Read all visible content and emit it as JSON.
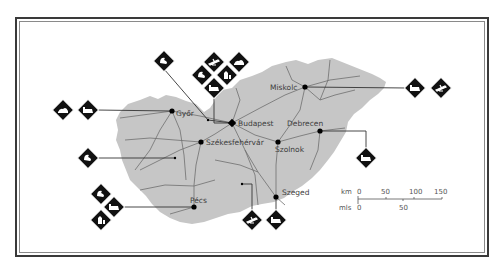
{
  "map": {
    "land_color": "#c8c8c8",
    "road_color": "#6e6e6e",
    "frame_color": "#3a3a3a",
    "icon_color": "#111111",
    "cities": [
      {
        "name": "Győr",
        "x": 172,
        "y": 111
      },
      {
        "name": "Budapest",
        "x": 232,
        "y": 123
      },
      {
        "name": "Miskolc",
        "x": 305,
        "y": 87
      },
      {
        "name": "Debrecen",
        "x": 320,
        "y": 131
      },
      {
        "name": "Székesfehérvár",
        "x": 201,
        "y": 142
      },
      {
        "name": "Szolnok",
        "x": 278,
        "y": 142
      },
      {
        "name": "Pécs",
        "x": 194,
        "y": 207
      },
      {
        "name": "Szeged",
        "x": 276,
        "y": 197
      }
    ],
    "labels": {
      "gyor": "Győr",
      "budapest": "Budapest",
      "miskolc": "Miskolc",
      "debrecen": "Debrecen",
      "szekesfehervar": "Székesfehérvár",
      "szolnok": "Szolnok",
      "pecs": "Pécs",
      "szeged": "Szeged"
    },
    "icons": [
      {
        "name": "thermal-bath-icon",
        "group": "gyor",
        "x": 63,
        "y": 110
      },
      {
        "name": "castle-icon",
        "group": "gyor",
        "x": 88,
        "y": 110
      },
      {
        "name": "lake-icon",
        "group": "north-west",
        "x": 164,
        "y": 61
      },
      {
        "name": "lake-icon",
        "group": "budapest",
        "x": 202,
        "y": 75
      },
      {
        "name": "airport-icon",
        "group": "budapest",
        "x": 214,
        "y": 62
      },
      {
        "name": "thermal-bath-icon",
        "group": "budapest",
        "x": 239,
        "y": 62
      },
      {
        "name": "church-icon",
        "group": "budapest",
        "x": 227,
        "y": 75
      },
      {
        "name": "castle-icon",
        "group": "budapest",
        "x": 214,
        "y": 88
      },
      {
        "name": "castle-icon",
        "group": "miskolc",
        "x": 415,
        "y": 88
      },
      {
        "name": "airport-icon",
        "group": "miskolc",
        "x": 441,
        "y": 88
      },
      {
        "name": "lake-icon",
        "group": "balaton",
        "x": 88,
        "y": 158
      },
      {
        "name": "castle-icon",
        "group": "debrecen",
        "x": 366,
        "y": 158
      },
      {
        "name": "lake-icon",
        "group": "pecs",
        "x": 101,
        "y": 194
      },
      {
        "name": "castle-icon",
        "group": "pecs",
        "x": 114,
        "y": 207
      },
      {
        "name": "church-icon",
        "group": "pecs",
        "x": 101,
        "y": 220
      },
      {
        "name": "airport-icon",
        "group": "szeged",
        "x": 252,
        "y": 220
      },
      {
        "name": "castle-icon",
        "group": "szeged",
        "x": 276,
        "y": 220
      }
    ],
    "scale": {
      "km_label": "km",
      "mls_label": "mls",
      "km_ticks": [
        "0",
        "50",
        "100",
        "150"
      ],
      "mls_ticks": [
        "0",
        "50"
      ]
    }
  }
}
